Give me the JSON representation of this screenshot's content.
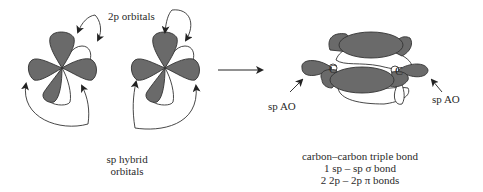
{
  "diagram": {
    "type": "orbital-diagram",
    "colors": {
      "shaded_lobe": "#6a6a6a",
      "unshaded_lobe": "#ffffff",
      "outline": "#333333",
      "text": "#2a2a2a"
    },
    "left_panel": {
      "top_label": "2p orbitals",
      "bottom_label_line1": "sp hybrid",
      "bottom_label_line2": "orbitals",
      "atoms": 2
    },
    "transition_arrow": "right-arrow",
    "right_panel": {
      "atom_label_left": "C",
      "atom_label_right": "C",
      "pointer_left_label": "sp AO",
      "pointer_right_label": "sp AO",
      "caption_line1": "carbon–carbon triple bond",
      "caption_line2": "1 sp – sp σ bond",
      "caption_line3": "2 2p – 2p π bonds"
    }
  }
}
